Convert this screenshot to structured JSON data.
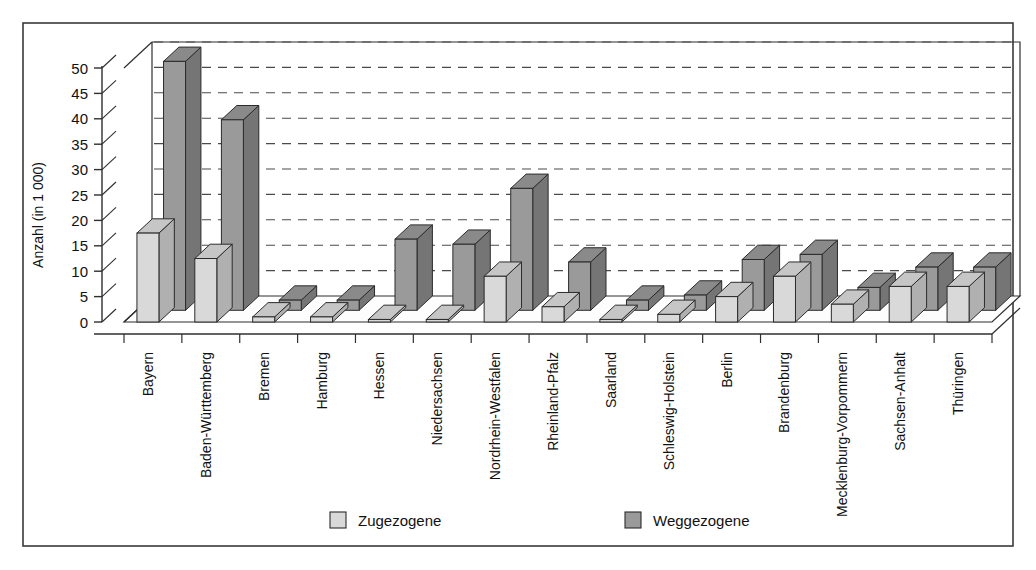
{
  "frame": {
    "border_color": "#3a3a3a",
    "background": "#ffffff"
  },
  "chart_data": {
    "type": "bar",
    "title": "",
    "subtitle": "",
    "xlabel": "",
    "ylabel": "Anzahl (in 1 000)",
    "ylim": [
      0,
      50
    ],
    "yticks": [
      0,
      5,
      10,
      15,
      20,
      25,
      30,
      35,
      40,
      45,
      50
    ],
    "ytick_labels": [
      "0",
      "5",
      "10",
      "15",
      "20",
      "25",
      "30",
      "35",
      "40",
      "45",
      "50"
    ],
    "grid": true,
    "grid_style": "dashed-horizontal",
    "legend_position": "bottom",
    "three_d": true,
    "categories": [
      "Bayern",
      "Baden-Württemberg",
      "Bremen",
      "Hamburg",
      "Hessen",
      "Niedersachsen",
      "Nordrhein-Westfalen",
      "Rheinland-Pfalz",
      "Saarland",
      "Schleswig-Holstein",
      "Berlin",
      "Brandenburg",
      "Mecklenburg-Vorpommern",
      "Sachsen-Anhalt",
      "Thüringen"
    ],
    "series": [
      {
        "name": "Zugezogene",
        "color": "#d9d9d9",
        "top_color": "#c6c6c6",
        "side_color": "#b0b0b0",
        "values": [
          17.5,
          12.5,
          1.0,
          1.0,
          0.5,
          0.5,
          9.0,
          3.0,
          0.5,
          1.5,
          5.0,
          9.0,
          3.5,
          7.0,
          7.0
        ]
      },
      {
        "name": "Weggezogene",
        "color": "#9a9a9a",
        "top_color": "#8a8a8a",
        "side_color": "#757575",
        "values": [
          49.0,
          37.5,
          2.0,
          2.0,
          14.0,
          13.0,
          24.0,
          9.5,
          2.0,
          3.0,
          10.0,
          11.0,
          4.5,
          8.5,
          8.5
        ]
      }
    ]
  },
  "legend": {
    "items": [
      {
        "label": "Zugezogene",
        "color": "#d9d9d9"
      },
      {
        "label": "Weggezogene",
        "color": "#9a9a9a"
      }
    ]
  }
}
